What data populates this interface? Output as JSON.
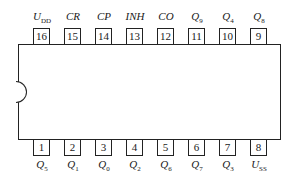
{
  "diagram": {
    "type": "ic-pinout-dip16",
    "top_pins": [
      {
        "num": "16",
        "name": "U",
        "sub": "DD"
      },
      {
        "num": "15",
        "name": "CR",
        "sub": ""
      },
      {
        "num": "14",
        "name": "CP",
        "sub": ""
      },
      {
        "num": "13",
        "name": "INH",
        "sub": ""
      },
      {
        "num": "12",
        "name": "CO",
        "sub": ""
      },
      {
        "num": "11",
        "name": "Q",
        "sub": "9"
      },
      {
        "num": "10",
        "name": "Q",
        "sub": "4"
      },
      {
        "num": "9",
        "name": "Q",
        "sub": "8"
      }
    ],
    "bottom_pins": [
      {
        "num": "1",
        "name": "Q",
        "sub": "5"
      },
      {
        "num": "2",
        "name": "Q",
        "sub": "1"
      },
      {
        "num": "3",
        "name": "Q",
        "sub": "0"
      },
      {
        "num": "4",
        "name": "Q",
        "sub": "2"
      },
      {
        "num": "5",
        "name": "Q",
        "sub": "6"
      },
      {
        "num": "6",
        "name": "Q",
        "sub": "7"
      },
      {
        "num": "7",
        "name": "Q",
        "sub": "3"
      },
      {
        "num": "8",
        "name": "U",
        "sub": "SS"
      }
    ]
  }
}
